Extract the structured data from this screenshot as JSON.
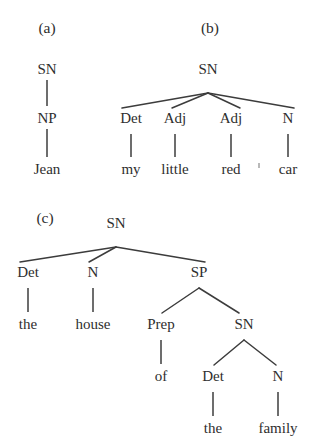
{
  "figure": {
    "kind": "syntax-tree-diagram",
    "background_color": "#ffffff",
    "ink_color": "#2e2e2e",
    "branch_color": "#3c3c3c",
    "panels": [
      {
        "id": "a",
        "label": "(a)",
        "label_pos": {
          "x": 47,
          "y": 33
        },
        "nodes": [
          {
            "id": "a-sn",
            "text": "SN",
            "type": "node",
            "x": 47,
            "y": 74
          },
          {
            "id": "a-np",
            "text": "NP",
            "type": "node",
            "x": 47,
            "y": 123
          },
          {
            "id": "a-jean",
            "text": "Jean",
            "type": "leaf",
            "x": 47,
            "y": 174
          }
        ],
        "edges": [
          {
            "from": "a-sn",
            "to": "a-np",
            "x1": 47,
            "y1": 80,
            "x2": 47,
            "y2": 106,
            "style": "stem"
          },
          {
            "from": "a-np",
            "to": "a-jean",
            "x1": 47,
            "y1": 129,
            "x2": 47,
            "y2": 157,
            "style": "stem"
          }
        ]
      },
      {
        "id": "b",
        "label": "(b)",
        "label_pos": {
          "x": 210,
          "y": 33
        },
        "nodes": [
          {
            "id": "b-sn",
            "text": "SN",
            "type": "node",
            "x": 208,
            "y": 74
          },
          {
            "id": "b-det",
            "text": "Det",
            "type": "node",
            "x": 131,
            "y": 123
          },
          {
            "id": "b-adj1",
            "text": "Adj",
            "type": "node",
            "x": 175,
            "y": 123
          },
          {
            "id": "b-adj2",
            "text": "Adj",
            "type": "node",
            "x": 231,
            "y": 123
          },
          {
            "id": "b-n",
            "text": "N",
            "type": "node",
            "x": 288,
            "y": 123
          },
          {
            "id": "b-my",
            "text": "my",
            "type": "leaf",
            "x": 131,
            "y": 174
          },
          {
            "id": "b-little",
            "text": "little",
            "type": "leaf",
            "x": 175,
            "y": 174
          },
          {
            "id": "b-red",
            "text": "red",
            "type": "leaf",
            "x": 231,
            "y": 174
          },
          {
            "id": "b-car",
            "text": "car",
            "type": "leaf",
            "x": 288,
            "y": 174
          }
        ],
        "edges": [
          {
            "from": "b-sn",
            "to": "b-det",
            "x1": 208,
            "y1": 93,
            "x2": 122,
            "y2": 108,
            "style": "branch"
          },
          {
            "from": "b-sn",
            "to": "b-adj1",
            "x1": 208,
            "y1": 93,
            "x2": 172,
            "y2": 108,
            "style": "branch"
          },
          {
            "from": "b-sn",
            "to": "b-adj2",
            "x1": 208,
            "y1": 93,
            "x2": 240,
            "y2": 108,
            "style": "branch"
          },
          {
            "from": "b-sn",
            "to": "b-n",
            "x1": 208,
            "y1": 93,
            "x2": 294,
            "y2": 108,
            "style": "branch"
          },
          {
            "from": "b-det",
            "to": "b-my",
            "x1": 131,
            "y1": 134,
            "x2": 131,
            "y2": 157,
            "style": "stem"
          },
          {
            "from": "b-adj1",
            "to": "b-little",
            "x1": 175,
            "y1": 134,
            "x2": 175,
            "y2": 157,
            "style": "stem"
          },
          {
            "from": "b-adj2",
            "to": "b-red",
            "x1": 231,
            "y1": 134,
            "x2": 231,
            "y2": 157,
            "style": "stem"
          },
          {
            "from": "b-n",
            "to": "b-car",
            "x1": 288,
            "y1": 134,
            "x2": 288,
            "y2": 157,
            "style": "stem"
          }
        ]
      },
      {
        "id": "c",
        "label": "(c)",
        "label_pos": {
          "x": 45,
          "y": 223
        },
        "nodes": [
          {
            "id": "c-sn",
            "text": "SN",
            "type": "node",
            "x": 116,
            "y": 228
          },
          {
            "id": "c-det",
            "text": "Det",
            "type": "node",
            "x": 28,
            "y": 277
          },
          {
            "id": "c-n",
            "text": "N",
            "type": "node",
            "x": 93,
            "y": 277
          },
          {
            "id": "c-sp",
            "text": "SP",
            "type": "node",
            "x": 199,
            "y": 277
          },
          {
            "id": "c-the1",
            "text": "the",
            "type": "leaf",
            "x": 28,
            "y": 329
          },
          {
            "id": "c-house",
            "text": "house",
            "type": "leaf",
            "x": 93,
            "y": 329
          },
          {
            "id": "c-prep",
            "text": "Prep",
            "type": "node",
            "x": 161,
            "y": 329
          },
          {
            "id": "c-sn2",
            "text": "SN",
            "type": "node",
            "x": 244,
            "y": 329
          },
          {
            "id": "c-of",
            "text": "of",
            "type": "leaf",
            "x": 161,
            "y": 381
          },
          {
            "id": "c-det2",
            "text": "Det",
            "type": "node",
            "x": 213,
            "y": 381
          },
          {
            "id": "c-n2",
            "text": "N",
            "type": "node",
            "x": 278,
            "y": 381
          },
          {
            "id": "c-the2",
            "text": "the",
            "type": "leaf",
            "x": 213,
            "y": 433
          },
          {
            "id": "c-family",
            "text": "family",
            "type": "leaf",
            "x": 278,
            "y": 433
          }
        ],
        "edges": [
          {
            "from": "c-sn",
            "to": "c-det",
            "x1": 116,
            "y1": 247,
            "x2": 20,
            "y2": 262,
            "style": "branch"
          },
          {
            "from": "c-sn",
            "to": "c-n",
            "x1": 116,
            "y1": 247,
            "x2": 89,
            "y2": 262,
            "style": "branch"
          },
          {
            "from": "c-sn",
            "to": "c-sp",
            "x1": 116,
            "y1": 247,
            "x2": 205,
            "y2": 262,
            "style": "branch"
          },
          {
            "from": "c-det",
            "to": "c-the1",
            "x1": 28,
            "y1": 288,
            "x2": 28,
            "y2": 312,
            "style": "stem"
          },
          {
            "from": "c-n",
            "to": "c-house",
            "x1": 93,
            "y1": 288,
            "x2": 93,
            "y2": 312,
            "style": "stem"
          },
          {
            "from": "c-sp",
            "to": "c-prep",
            "x1": 199,
            "y1": 288,
            "x2": 162,
            "y2": 313,
            "style": "branch"
          },
          {
            "from": "c-sp",
            "to": "c-sn2",
            "x1": 199,
            "y1": 288,
            "x2": 239,
            "y2": 313,
            "style": "branch"
          },
          {
            "from": "c-prep",
            "to": "c-of",
            "x1": 161,
            "y1": 340,
            "x2": 161,
            "y2": 364,
            "style": "stem"
          },
          {
            "from": "c-sn2",
            "to": "c-det2",
            "x1": 244,
            "y1": 340,
            "x2": 214,
            "y2": 365,
            "style": "branch"
          },
          {
            "from": "c-sn2",
            "to": "c-n2",
            "x1": 244,
            "y1": 340,
            "x2": 276,
            "y2": 365,
            "style": "branch"
          },
          {
            "from": "c-det2",
            "to": "c-the2",
            "x1": 213,
            "y1": 392,
            "x2": 213,
            "y2": 416,
            "style": "stem"
          },
          {
            "from": "c-n2",
            "to": "c-family",
            "x1": 278,
            "y1": 392,
            "x2": 278,
            "y2": 416,
            "style": "stem"
          }
        ]
      }
    ],
    "artifacts": [
      {
        "id": "scan-speck-b",
        "x": 258,
        "y": 163,
        "w": 2,
        "h": 5
      }
    ]
  }
}
